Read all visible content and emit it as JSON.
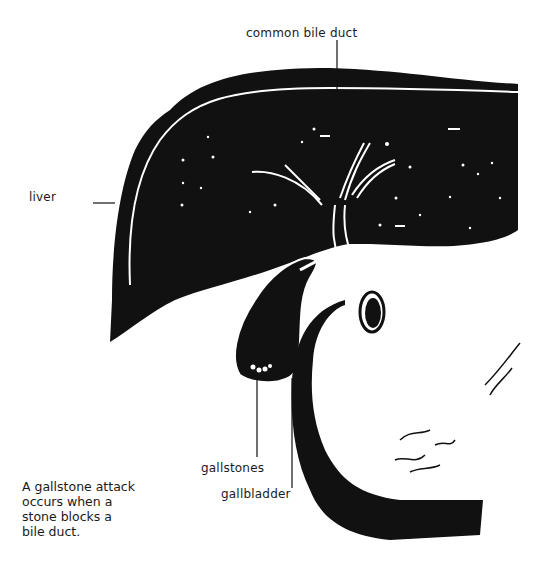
{
  "diagram": {
    "labels": {
      "common_bile_duct": "common bile duct",
      "liver": "liver",
      "gallstones": "gallstones",
      "gallbladder": "gallbladder"
    },
    "caption": "A gallstone attack\noccurs when a\nstone blocks a\nbile duct.",
    "colors": {
      "ink": "#111111",
      "paper": "#ffffff"
    }
  }
}
